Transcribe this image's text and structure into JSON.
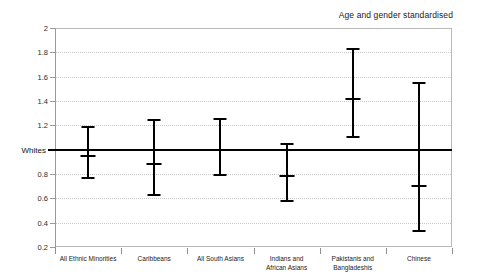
{
  "annotation": "Age and gender standardised",
  "reference_label": "Whites",
  "y_ticks": [
    "0.2",
    "0.4",
    "0.6",
    "0.8",
    "1.2",
    "1.4",
    "1.6",
    "1.8",
    "2"
  ],
  "chart_data": {
    "type": "scatter",
    "title": "",
    "subtitle": "",
    "annotations": [
      "Age and gender standardised"
    ],
    "xlabel": "",
    "ylabel": "",
    "ylim": [
      0.2,
      2.0
    ],
    "ytick_step": 0.2,
    "grid": true,
    "legend": "none",
    "reference_line": {
      "label": "Whites",
      "value": 1.0
    },
    "categories": [
      "All Ethnic Minorities",
      "Caribbeans",
      "All South Asians",
      "Indians and\nAfrican Asians",
      "Pakistanis and\nBangladeshis",
      "Chinese"
    ],
    "series": [
      {
        "name": "Ratio with 95% confidence interval",
        "values": [
          0.95,
          0.88,
          1.0,
          0.78,
          1.42,
          0.7
        ],
        "lower": [
          0.77,
          0.63,
          0.79,
          0.58,
          1.1,
          0.33
        ],
        "upper": [
          1.19,
          1.24,
          1.25,
          1.05,
          1.83,
          1.55
        ]
      }
    ],
    "points": [
      {
        "category": "All Ethnic Minorities",
        "value": 0.95,
        "lower": 0.77,
        "upper": 1.19
      },
      {
        "category": "Caribbeans",
        "value": 0.88,
        "lower": 0.63,
        "upper": 1.24
      },
      {
        "category": "All South Asians",
        "value": 1.0,
        "lower": 0.79,
        "upper": 1.25
      },
      {
        "category": "Indians and African Asians",
        "value": 0.78,
        "lower": 0.58,
        "upper": 1.05
      },
      {
        "category": "Pakistanis and Bangladeshis",
        "value": 1.42,
        "lower": 1.1,
        "upper": 1.83
      },
      {
        "category": "Chinese",
        "value": 0.7,
        "lower": 0.33,
        "upper": 1.55
      }
    ]
  }
}
